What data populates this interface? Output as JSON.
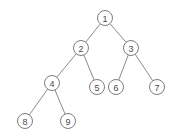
{
  "figure": {
    "background_color": "#ffffff",
    "node_fill_color": "#ffffff",
    "node_stroke_color": "#7d7d7d",
    "edge_color": "#8a8a8a",
    "label_color": "#4a4a4a",
    "node_radius": 7.5
  },
  "chart_data": {
    "type": "diagram",
    "title": "",
    "xlabel": "",
    "ylabel": "",
    "grid": false,
    "legend": null,
    "nodes": [
      {
        "id": "1",
        "label": "1",
        "x": 105,
        "y": 18,
        "level": 0
      },
      {
        "id": "2",
        "label": "2",
        "x": 81,
        "y": 48,
        "level": 1
      },
      {
        "id": "3",
        "label": "3",
        "x": 131,
        "y": 48,
        "level": 1
      },
      {
        "id": "4",
        "label": "4",
        "x": 52,
        "y": 83,
        "level": 2
      },
      {
        "id": "5",
        "label": "5",
        "x": 97,
        "y": 87,
        "level": 2
      },
      {
        "id": "6",
        "label": "6",
        "x": 116,
        "y": 87,
        "level": 2
      },
      {
        "id": "7",
        "label": "7",
        "x": 157,
        "y": 87,
        "level": 2
      },
      {
        "id": "8",
        "label": "8",
        "x": 25,
        "y": 121,
        "level": 3
      },
      {
        "id": "9",
        "label": "9",
        "x": 68,
        "y": 121,
        "level": 3
      }
    ],
    "edges": [
      {
        "from": "1",
        "to": "2",
        "x1": 105,
        "y1": 18,
        "x2": 81,
        "y2": 48
      },
      {
        "from": "1",
        "to": "3",
        "x1": 105,
        "y1": 18,
        "x2": 131,
        "y2": 48
      },
      {
        "from": "2",
        "to": "4",
        "x1": 81,
        "y1": 48,
        "x2": 52,
        "y2": 83
      },
      {
        "from": "2",
        "to": "5",
        "x1": 81,
        "y1": 48,
        "x2": 97,
        "y2": 87
      },
      {
        "from": "3",
        "to": "6",
        "x1": 131,
        "y1": 48,
        "x2": 116,
        "y2": 87
      },
      {
        "from": "3",
        "to": "7",
        "x1": 131,
        "y1": 48,
        "x2": 157,
        "y2": 87
      },
      {
        "from": "4",
        "to": "8",
        "x1": 52,
        "y1": 83,
        "x2": 25,
        "y2": 121
      },
      {
        "from": "4",
        "to": "9",
        "x1": 52,
        "y1": 83,
        "x2": 68,
        "y2": 121
      }
    ]
  }
}
